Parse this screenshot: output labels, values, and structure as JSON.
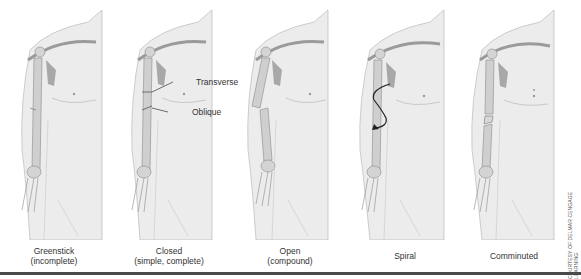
{
  "figures": [
    {
      "id": "greenstick",
      "label": "Greenstick",
      "sublabel": "(incomplete)"
    },
    {
      "id": "closed",
      "label": "Closed",
      "sublabel": "(simple, complete)",
      "callouts": [
        "Transverse",
        "Oblique"
      ]
    },
    {
      "id": "open",
      "label": "Open",
      "sublabel": "(compound)"
    },
    {
      "id": "spiral",
      "label": "Spiral",
      "sublabel": ""
    },
    {
      "id": "comminuted",
      "label": "Comminuted",
      "sublabel": ""
    }
  ],
  "credit": "COURTESY OF DELMAR CENGAGE LEARNING",
  "colors": {
    "skin": "#ececec",
    "skin_outline": "#b0b0b0",
    "bone": "#cfcfcf",
    "bone_outline": "#8a8a8a",
    "muscle": "#a8a8a8",
    "spiral_arrow": "#222222",
    "rule": "#4a4a4a"
  }
}
